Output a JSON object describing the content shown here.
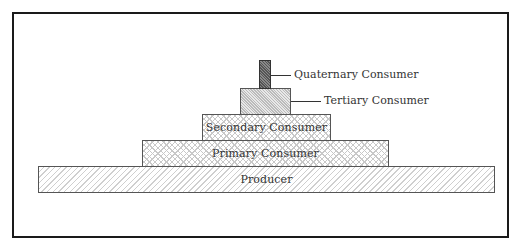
{
  "diagram": {
    "type": "energy-pyramid",
    "levels": [
      {
        "name": "Producer",
        "label": "Producer",
        "label_position": "inside"
      },
      {
        "name": "Primary Consumer",
        "label": "Primary Consumer",
        "label_position": "inside"
      },
      {
        "name": "Secondary Consumer",
        "label": "Secondary Consumer",
        "label_position": "inside"
      },
      {
        "name": "Tertiary Consumer",
        "label": "Tertiary Consumer",
        "label_position": "outside-right"
      },
      {
        "name": "Quaternary Consumer",
        "label": "Quaternary Consumer",
        "label_position": "outside-right"
      }
    ],
    "colors": {
      "frame": "#1a1a1a",
      "outline": "#555555",
      "text": "#333333",
      "quaternary_fill": "#6e6e6e"
    }
  },
  "caption": {
    "text": ""
  }
}
